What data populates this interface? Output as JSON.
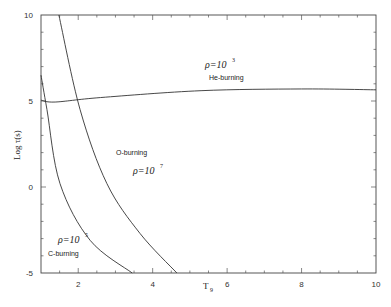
{
  "chart_data": {
    "type": "line",
    "title": "",
    "xlabel": "T9",
    "ylabel": "Log τ(s)",
    "xlim": [
      1,
      10
    ],
    "ylim": [
      -5,
      10
    ],
    "grid": false,
    "x_ticks": [
      2,
      4,
      6,
      8,
      10
    ],
    "y_ticks": [
      -5,
      0,
      5,
      10
    ],
    "x_tick_labels": [
      "2",
      "4",
      "6",
      "8",
      "10"
    ],
    "y_tick_labels": [
      "-5",
      "0",
      "5",
      "10"
    ],
    "series": [
      {
        "name": "C-burning",
        "density_label": "ρ=10",
        "density_exponent": "5",
        "x": [
          1.0,
          1.16,
          1.51,
          2.32,
          3.45
        ],
        "y": [
          6.5,
          4.5,
          0.2,
          -3.1,
          -5.0
        ]
      },
      {
        "name": "O-burning",
        "density_label": "ρ=10",
        "density_exponent": "7",
        "x": [
          1.48,
          2.05,
          2.77,
          3.66,
          4.65
        ],
        "y": [
          10.0,
          4.5,
          0.2,
          -2.7,
          -5.0
        ]
      },
      {
        "name": "He-burning",
        "density_label": "ρ=10",
        "density_exponent": "3",
        "x": [
          1.0,
          1.38,
          2.6,
          5.3,
          8.0,
          10.0
        ],
        "y": [
          5.05,
          4.94,
          5.2,
          5.6,
          5.7,
          5.65
        ]
      }
    ],
    "annotations": [
      {
        "text": "ρ=10^3",
        "x": 5.5,
        "y": 7.1
      },
      {
        "text": "He-burning",
        "x": 5.4,
        "y": 6.3
      },
      {
        "text": "O-burning",
        "x": 3.0,
        "y": 1.6
      },
      {
        "text": "ρ=10^7",
        "x": 3.5,
        "y": 0.6
      },
      {
        "text": "ρ=10^5",
        "x": 1.6,
        "y": -2.8
      },
      {
        "text": "C-burning",
        "x": 1.4,
        "y": -3.7
      }
    ]
  },
  "labels": {
    "xlabel_main": "T",
    "xlabel_sub": "9",
    "ylabel": "Log τ(s)",
    "rho_prefix": "ρ=10",
    "he": {
      "exp": "3",
      "name": "He-burning"
    },
    "o": {
      "exp": "7",
      "name": "O-burning"
    },
    "c": {
      "exp": "5",
      "name": "C-burning"
    }
  }
}
